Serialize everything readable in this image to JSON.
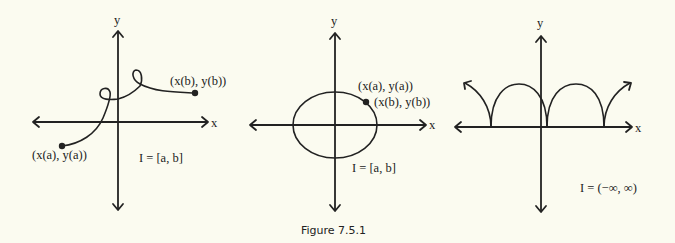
{
  "figure": {
    "caption": "Figure 7.5.1",
    "background": "#fbfbf0",
    "ink": "#222222"
  },
  "panels": [
    {
      "id": "open-curve",
      "axis_labels": {
        "x": "x",
        "y": "y"
      },
      "start_label": "(x(a), y(a))",
      "end_label": "(x(b), y(b))",
      "interval": "I = [a, b]",
      "description": "Curve with two loops from start point to end point"
    },
    {
      "id": "closed-curve",
      "axis_labels": {
        "x": "x",
        "y": "y"
      },
      "start_label": "(x(a), y(a))",
      "end_label": "(x(b), y(b))",
      "interval": "I = [a, b]",
      "description": "Closed ellipse where start and end points coincide"
    },
    {
      "id": "cycloid",
      "axis_labels": {
        "x": "x",
        "y": "y"
      },
      "interval": "I = (−∞, ∞)",
      "description": "Periodic arches (cycloid) extending infinitely in both directions"
    }
  ]
}
